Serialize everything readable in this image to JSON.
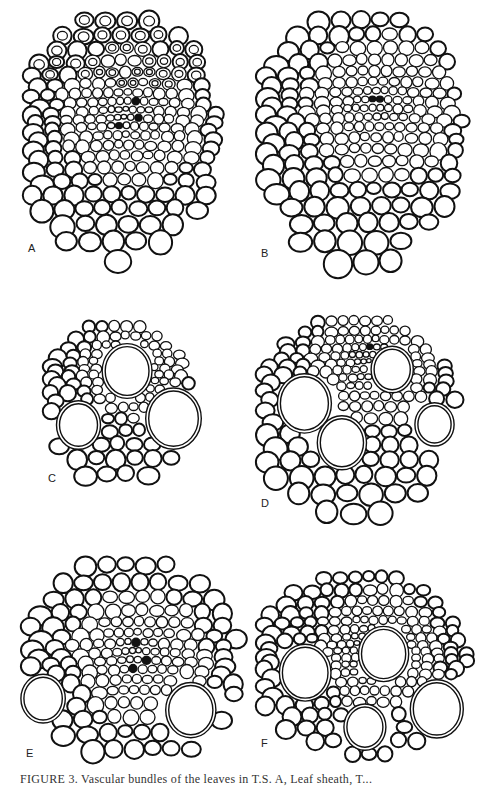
{
  "figure": {
    "caption": "FIGURE 3. Vascular bundles of the leaves in T.S. A, Leaf sheath, T...",
    "panels": [
      {
        "label": "A",
        "x": 22,
        "y": 10,
        "w": 195,
        "h": 250,
        "cell": 17,
        "dense_center": [
          0.5,
          0.4
        ],
        "large_cells": 0,
        "seed": 11
      },
      {
        "label": "B",
        "x": 255,
        "y": 10,
        "w": 210,
        "h": 255,
        "cell": 18,
        "dense_center": [
          0.55,
          0.35
        ],
        "large_cells": 0,
        "seed": 23
      },
      {
        "label": "C",
        "x": 42,
        "y": 320,
        "w": 150,
        "h": 170,
        "cell": 14,
        "dense_center": [
          0.55,
          0.25
        ],
        "large_cells": 3,
        "seed": 37
      },
      {
        "label": "D",
        "x": 255,
        "y": 315,
        "w": 200,
        "h": 200,
        "cell": 15,
        "dense_center": [
          0.55,
          0.2
        ],
        "large_cells": 4,
        "seed": 41
      },
      {
        "label": "E",
        "x": 20,
        "y": 555,
        "w": 220,
        "h": 210,
        "cell": 18,
        "dense_center": [
          0.5,
          0.45
        ],
        "large_cells": 2,
        "seed": 53
      },
      {
        "label": "F",
        "x": 255,
        "y": 570,
        "w": 210,
        "h": 185,
        "cell": 14,
        "dense_center": [
          0.55,
          0.4
        ],
        "large_cells": 4,
        "seed": 67
      }
    ]
  }
}
